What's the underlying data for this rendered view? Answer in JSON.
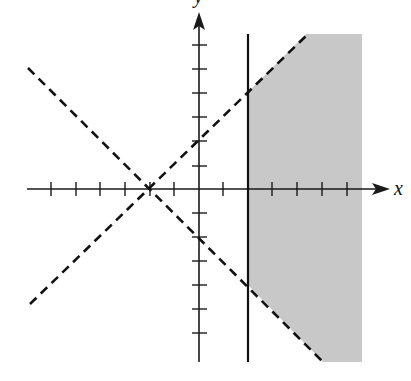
{
  "diagram": {
    "title": "",
    "colors": {
      "axis": "#1a1a1a",
      "boundary": "#111111",
      "shade": "#c8c8c8",
      "background": "#ffffff"
    },
    "axes": {
      "x_label": "x",
      "y_label": "y",
      "x_range": [
        -6,
        6
      ],
      "y_range": [
        -7,
        7
      ],
      "tick_spacing": 1
    },
    "boundaries": [
      {
        "id": "line-upper",
        "equation": "y = x + 2",
        "style": "dashed"
      },
      {
        "id": "line-lower",
        "equation": "y = -x - 2",
        "style": "dashed"
      },
      {
        "id": "line-vertical",
        "equation": "x = 2",
        "style": "solid"
      }
    ],
    "intersection_point": {
      "x": -2,
      "y": 0
    },
    "shaded_region": "x >= 2, y < x + 2, y > -x - 2"
  }
}
